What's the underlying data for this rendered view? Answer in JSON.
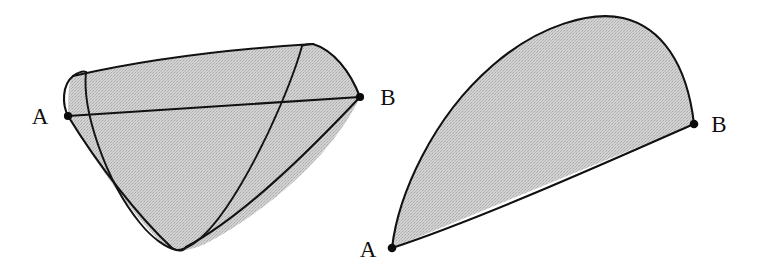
{
  "figure": {
    "background_color": "#ffffff",
    "stroke_color": "#111111",
    "fill_color": "#cccccc",
    "fill_texture": "stippled-gray",
    "caption": "",
    "panels": [
      {
        "id": "left-panel",
        "name": "cone-surface-with-elliptical-geodesic",
        "description": "A shaded cone-like surface seen in perspective with a straight chord from A to B and an elliptical cross-section curve passing through both endpoints",
        "labels": [
          {
            "text": "A",
            "x": 40,
            "y": 124,
            "point_x": 68,
            "point_y": 116
          },
          {
            "text": "B",
            "x": 381,
            "y": 105,
            "point_x": 360,
            "point_y": 97
          }
        ],
        "vertices": [
          {
            "name": "A",
            "x": 68,
            "y": 116
          },
          {
            "name": "B",
            "x": 360,
            "y": 97
          }
        ]
      },
      {
        "id": "right-panel",
        "name": "lens-shaped-shaded-region",
        "description": "A shaded wing or lens shaped region bounded by a large convex arc above and a gently curved edge below, meeting at vertices A and B",
        "labels": [
          {
            "text": "A",
            "x": 362,
            "y": 256,
            "point_x": 392,
            "point_y": 248
          },
          {
            "text": "B",
            "x": 713,
            "y": 131,
            "point_x": 694,
            "point_y": 124
          }
        ],
        "vertices": [
          {
            "name": "A",
            "x": 392,
            "y": 248
          },
          {
            "name": "B",
            "x": 694,
            "y": 124
          }
        ]
      }
    ],
    "labels_text": {
      "left_a": "A",
      "left_b": "B",
      "right_a": "A",
      "right_b": "B"
    }
  }
}
